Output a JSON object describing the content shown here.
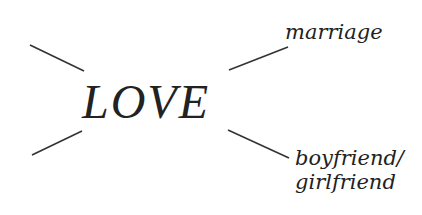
{
  "diagram": {
    "center": {
      "label": "LOVE"
    },
    "branches": [
      {
        "id": "top-left",
        "label": "",
        "line": {
          "x1": 30,
          "y1": 45,
          "x2": 84,
          "y2": 71
        }
      },
      {
        "id": "bottom-left",
        "label": "",
        "line": {
          "x1": 32,
          "y1": 155,
          "x2": 82,
          "y2": 131
        }
      },
      {
        "id": "top-right",
        "label": "marriage",
        "line": {
          "x1": 229,
          "y1": 70,
          "x2": 288,
          "y2": 47
        }
      },
      {
        "id": "bottom-right",
        "label_lines": [
          "boyfriend/",
          "girlfriend"
        ],
        "line": {
          "x1": 228,
          "y1": 130,
          "x2": 289,
          "y2": 158
        }
      }
    ]
  },
  "colors": {
    "ink": "#222222",
    "line": "#333333",
    "background": "#ffffff"
  }
}
